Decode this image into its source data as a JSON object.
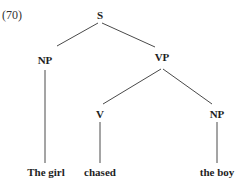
{
  "example": {
    "label": "(70)"
  },
  "tree": {
    "nodes": [
      {
        "id": "S",
        "label": "S",
        "x": 100,
        "y": 15
      },
      {
        "id": "NP1",
        "label": "NP",
        "x": 45,
        "y": 60
      },
      {
        "id": "VP",
        "label": "VP",
        "x": 162,
        "y": 57
      },
      {
        "id": "V",
        "label": "V",
        "x": 100,
        "y": 114
      },
      {
        "id": "NP2",
        "label": "NP",
        "x": 217,
        "y": 114
      },
      {
        "id": "leaf1",
        "label": "The girl",
        "x": 46,
        "y": 172
      },
      {
        "id": "leaf2",
        "label": "chased",
        "x": 100,
        "y": 172
      },
      {
        "id": "leaf3",
        "label": "the boy",
        "x": 217,
        "y": 172
      }
    ],
    "edges": [
      {
        "from": "S",
        "to": "NP1",
        "x1": 98,
        "y1": 23,
        "x2": 57,
        "y2": 46
      },
      {
        "from": "S",
        "to": "VP",
        "x1": 102,
        "y1": 23,
        "x2": 155,
        "y2": 47
      },
      {
        "from": "NP1",
        "to": "leaf1",
        "x1": 45,
        "y1": 70,
        "x2": 45,
        "y2": 163
      },
      {
        "from": "VP",
        "to": "V",
        "x1": 161,
        "y1": 69,
        "x2": 103,
        "y2": 104
      },
      {
        "from": "VP",
        "to": "NP2",
        "x1": 163,
        "y1": 69,
        "x2": 212,
        "y2": 104
      },
      {
        "from": "V",
        "to": "leaf2",
        "x1": 100,
        "y1": 122,
        "x2": 100,
        "y2": 163
      },
      {
        "from": "NP2",
        "to": "leaf3",
        "x1": 217,
        "y1": 122,
        "x2": 217,
        "y2": 163
      }
    ],
    "line_color": "#4a4a4a"
  }
}
